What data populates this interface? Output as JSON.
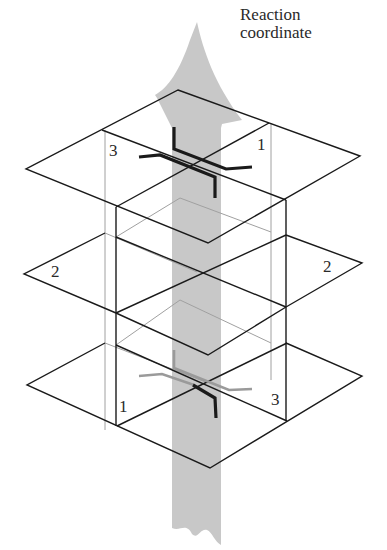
{
  "diagram": {
    "axis_label_line1": "Reaction",
    "axis_label_line2": "coordinate",
    "planes": [
      {
        "name": "top",
        "left_label": "3",
        "right_label": "1"
      },
      {
        "name": "middle",
        "left_label": "2",
        "right_label": "2"
      },
      {
        "name": "bottom",
        "left_label": "1",
        "right_label": "3"
      }
    ],
    "colors": {
      "arrow": "#c4c4c4",
      "line": "#1a1a1a",
      "hidden_line": "#9a9a9a",
      "molecule_front": "#1a1a1a",
      "molecule_back": "#9a9a9a"
    }
  }
}
